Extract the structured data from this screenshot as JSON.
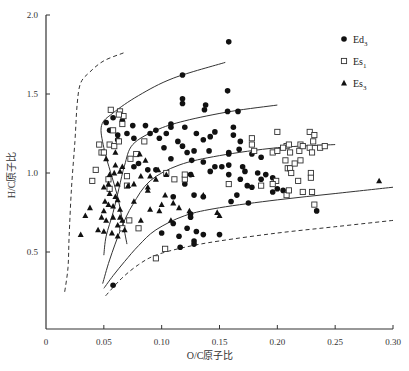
{
  "chart_data": {
    "type": "scatter",
    "title": "",
    "xlabel": "O/C原子比",
    "ylabel": "H/C原子比",
    "xlim": [
      0,
      0.3
    ],
    "ylim": [
      0,
      2.0
    ],
    "xticks": [
      0,
      0.05,
      0.1,
      0.15,
      0.2,
      0.25,
      0.3
    ],
    "xtick_labels": [
      "0",
      "0.05",
      "0.10",
      "0.15",
      "0.20",
      "0.25",
      "0.30"
    ],
    "yticks": [
      0.5,
      1.0,
      1.5,
      2.0
    ],
    "ytick_labels": [
      "0.5",
      "1.0",
      "1.5",
      "2.0"
    ],
    "grid": false,
    "legend_position": "upper right",
    "legend": [
      {
        "label": "Ed",
        "subscript": "3",
        "marker": "filled-circle"
      },
      {
        "label": "Es",
        "subscript": "1",
        "marker": "open-square"
      },
      {
        "label": "Es",
        "subscript": "3",
        "marker": "filled-triangle"
      }
    ],
    "series": [
      {
        "name": "Ed3",
        "marker": "filled-circle",
        "points": [
          [
            0.158,
            1.83
          ],
          [
            0.118,
            1.62
          ],
          [
            0.118,
            1.47
          ],
          [
            0.118,
            1.44
          ],
          [
            0.157,
            1.52
          ],
          [
            0.138,
            1.43
          ],
          [
            0.137,
            1.4
          ],
          [
            0.157,
            1.39
          ],
          [
            0.166,
            1.39
          ],
          [
            0.108,
            1.31
          ],
          [
            0.108,
            1.29
          ],
          [
            0.098,
            1.22
          ],
          [
            0.104,
            1.25
          ],
          [
            0.066,
            1.33
          ],
          [
            0.075,
            1.3
          ],
          [
            0.058,
            1.35
          ],
          [
            0.052,
            1.32
          ],
          [
            0.055,
            1.27
          ],
          [
            0.062,
            1.24
          ],
          [
            0.07,
            1.25
          ],
          [
            0.076,
            1.22
          ],
          [
            0.062,
            1.21
          ],
          [
            0.086,
            1.3
          ],
          [
            0.09,
            1.25
          ],
          [
            0.095,
            1.27
          ],
          [
            0.142,
            1.23
          ],
          [
            0.146,
            1.26
          ],
          [
            0.136,
            1.21
          ],
          [
            0.13,
            1.25
          ],
          [
            0.12,
            1.29
          ],
          [
            0.128,
            1.14
          ],
          [
            0.141,
            1.14
          ],
          [
            0.162,
            1.24
          ],
          [
            0.168,
            1.2
          ],
          [
            0.162,
            1.29
          ],
          [
            0.102,
            1.16
          ],
          [
            0.108,
            1.09
          ],
          [
            0.114,
            1.2
          ],
          [
            0.118,
            1.17
          ],
          [
            0.122,
            1.13
          ],
          [
            0.126,
            1.08
          ],
          [
            0.136,
            1.07
          ],
          [
            0.142,
            1.01
          ],
          [
            0.146,
            1.04
          ],
          [
            0.152,
            1.04
          ],
          [
            0.158,
            1.13
          ],
          [
            0.158,
            1.12
          ],
          [
            0.158,
            1.05
          ],
          [
            0.158,
            0.99
          ],
          [
            0.167,
            1.15
          ],
          [
            0.17,
            1.04
          ],
          [
            0.172,
            1.01
          ],
          [
            0.168,
            0.96
          ],
          [
            0.178,
            0.91
          ],
          [
            0.165,
            0.86
          ],
          [
            0.174,
            0.92
          ],
          [
            0.186,
            1.1
          ],
          [
            0.19,
            0.99
          ],
          [
            0.196,
            0.97
          ],
          [
            0.178,
            1.12
          ],
          [
            0.183,
            1.0
          ],
          [
            0.186,
            0.96
          ],
          [
            0.2,
            0.9
          ],
          [
            0.205,
            0.89
          ],
          [
            0.196,
            0.88
          ],
          [
            0.125,
            0.99
          ],
          [
            0.12,
            0.93
          ],
          [
            0.128,
            0.86
          ],
          [
            0.136,
            0.85
          ],
          [
            0.11,
            0.85
          ],
          [
            0.125,
            0.74
          ],
          [
            0.125,
            0.72
          ],
          [
            0.11,
            0.68
          ],
          [
            0.122,
            0.65
          ],
          [
            0.115,
            0.6
          ],
          [
            0.128,
            0.57
          ],
          [
            0.128,
            0.55
          ],
          [
            0.1,
            0.62
          ],
          [
            0.08,
            1.06
          ],
          [
            0.076,
            1.04
          ],
          [
            0.088,
            1.02
          ],
          [
            0.095,
            1.02
          ],
          [
            0.175,
            0.81
          ],
          [
            0.16,
            0.82
          ],
          [
            0.15,
            0.61
          ],
          [
            0.234,
            0.76
          ],
          [
            0.058,
            0.29
          ],
          [
            0.13,
            0.63
          ],
          [
            0.136,
            0.61
          ],
          [
            0.116,
            0.53
          ]
        ]
      },
      {
        "name": "Es1",
        "marker": "open-square",
        "points": [
          [
            0.056,
            1.4
          ],
          [
            0.064,
            1.39
          ],
          [
            0.067,
            1.36
          ],
          [
            0.063,
            1.37
          ],
          [
            0.066,
            1.31
          ],
          [
            0.058,
            1.27
          ],
          [
            0.046,
            1.18
          ],
          [
            0.048,
            1.13
          ],
          [
            0.055,
            1.18
          ],
          [
            0.059,
            1.17
          ],
          [
            0.063,
            1.2
          ],
          [
            0.073,
            1.09
          ],
          [
            0.078,
            1.12
          ],
          [
            0.085,
            1.2
          ],
          [
            0.05,
            1.13
          ],
          [
            0.043,
            1.02
          ],
          [
            0.04,
            0.95
          ],
          [
            0.07,
            0.98
          ],
          [
            0.054,
            0.96
          ],
          [
            0.055,
            0.9
          ],
          [
            0.07,
            0.92
          ],
          [
            0.104,
            1.0
          ],
          [
            0.111,
            0.96
          ],
          [
            0.12,
            0.96
          ],
          [
            0.12,
            0.99
          ],
          [
            0.072,
            0.7
          ],
          [
            0.066,
            0.65
          ],
          [
            0.08,
            0.65
          ],
          [
            0.095,
            0.46
          ],
          [
            0.103,
            0.52
          ],
          [
            0.158,
            0.93
          ],
          [
            0.196,
            1.13
          ],
          [
            0.207,
            1.08
          ],
          [
            0.209,
            1.03
          ],
          [
            0.211,
            1.03
          ],
          [
            0.22,
            1.18
          ],
          [
            0.228,
            1.16
          ],
          [
            0.231,
            1.2
          ],
          [
            0.237,
            1.16
          ],
          [
            0.229,
            1.0
          ],
          [
            0.229,
            0.97
          ],
          [
            0.211,
            1.13
          ],
          [
            0.219,
            1.14
          ],
          [
            0.212,
            1.0
          ],
          [
            0.215,
            1.06
          ],
          [
            0.178,
            1.18
          ],
          [
            0.18,
            1.14
          ],
          [
            0.2,
            1.14
          ],
          [
            0.208,
            1.17
          ],
          [
            0.205,
            1.16
          ],
          [
            0.222,
            1.17
          ],
          [
            0.23,
            1.13
          ],
          [
            0.241,
            1.17
          ],
          [
            0.186,
            0.92
          ],
          [
            0.199,
            0.95
          ],
          [
            0.218,
            0.95
          ],
          [
            0.196,
            0.93
          ],
          [
            0.22,
            1.08
          ],
          [
            0.23,
            0.88
          ],
          [
            0.232,
            0.8
          ],
          [
            0.208,
            0.86
          ],
          [
            0.21,
            0.89
          ],
          [
            0.222,
            0.88
          ],
          [
            0.228,
            1.26
          ],
          [
            0.21,
            1.18
          ],
          [
            0.178,
            1.22
          ],
          [
            0.2,
            1.26
          ],
          [
            0.232,
            1.24
          ]
        ]
      },
      {
        "name": "Es3",
        "marker": "filled-triangle",
        "points": [
          [
            0.06,
            1.13
          ],
          [
            0.081,
            1.12
          ],
          [
            0.086,
            1.08
          ],
          [
            0.097,
            1.02
          ],
          [
            0.104,
            0.99
          ],
          [
            0.052,
            1.09
          ],
          [
            0.06,
            1.05
          ],
          [
            0.066,
            1.04
          ],
          [
            0.064,
            1.01
          ],
          [
            0.059,
            1.0
          ],
          [
            0.082,
            0.98
          ],
          [
            0.09,
            0.98
          ],
          [
            0.076,
            0.93
          ],
          [
            0.088,
            0.91
          ],
          [
            0.055,
            0.99
          ],
          [
            0.054,
            0.93
          ],
          [
            0.062,
            0.93
          ],
          [
            0.071,
            0.92
          ],
          [
            0.076,
            0.82
          ],
          [
            0.05,
            0.91
          ],
          [
            0.055,
            0.87
          ],
          [
            0.06,
            0.85
          ],
          [
            0.051,
            0.82
          ],
          [
            0.058,
            0.79
          ],
          [
            0.064,
            0.77
          ],
          [
            0.062,
            0.83
          ],
          [
            0.058,
            0.72
          ],
          [
            0.066,
            0.7
          ],
          [
            0.05,
            0.76
          ],
          [
            0.054,
            0.8
          ],
          [
            0.048,
            0.72
          ],
          [
            0.052,
            0.7
          ],
          [
            0.045,
            0.64
          ],
          [
            0.05,
            0.63
          ],
          [
            0.057,
            0.62
          ],
          [
            0.062,
            0.67
          ],
          [
            0.068,
            0.64
          ],
          [
            0.064,
            0.72
          ],
          [
            0.062,
            0.6
          ],
          [
            0.034,
            0.73
          ],
          [
            0.038,
            0.78
          ],
          [
            0.03,
            0.61
          ],
          [
            0.095,
            0.96
          ],
          [
            0.088,
            0.89
          ],
          [
            0.1,
            0.8
          ],
          [
            0.09,
            0.77
          ],
          [
            0.098,
            0.76
          ],
          [
            0.108,
            0.7
          ],
          [
            0.115,
            0.78
          ],
          [
            0.082,
            0.7
          ],
          [
            0.103,
            0.86
          ],
          [
            0.11,
            0.81
          ],
          [
            0.136,
            0.86
          ],
          [
            0.126,
            0.99
          ],
          [
            0.148,
            0.75
          ],
          [
            0.15,
            0.73
          ],
          [
            0.124,
            0.76
          ],
          [
            0.288,
            0.95
          ]
        ]
      }
    ],
    "curves": [
      {
        "name": "boundary-left-dashed",
        "style": "dashed",
        "points": [
          [
            0.067,
            1.76
          ],
          [
            0.05,
            1.71
          ],
          [
            0.038,
            1.64
          ],
          [
            0.03,
            1.57
          ],
          [
            0.027,
            1.44
          ],
          [
            0.025,
            1.2
          ],
          [
            0.022,
            0.9
          ],
          [
            0.02,
            0.6
          ],
          [
            0.019,
            0.4
          ],
          [
            0.016,
            0.24
          ]
        ]
      },
      {
        "name": "type-I-upper",
        "style": "solid",
        "points": [
          [
            0.155,
            1.7
          ],
          [
            0.11,
            1.6
          ],
          [
            0.08,
            1.49
          ],
          [
            0.058,
            1.38
          ],
          [
            0.048,
            1.3
          ],
          [
            0.05,
            1.16
          ],
          [
            0.056,
            1.0
          ],
          [
            0.062,
            0.85
          ],
          [
            0.066,
            0.7
          ],
          [
            0.07,
            0.55
          ]
        ]
      },
      {
        "name": "type-I-II",
        "style": "solid",
        "points": [
          [
            0.2,
            1.43
          ],
          [
            0.16,
            1.39
          ],
          [
            0.12,
            1.33
          ],
          [
            0.095,
            1.27
          ],
          [
            0.075,
            1.18
          ],
          [
            0.068,
            1.05
          ],
          [
            0.063,
            0.9
          ],
          [
            0.058,
            0.75
          ],
          [
            0.052,
            0.6
          ],
          [
            0.05,
            0.48
          ]
        ]
      },
      {
        "name": "type-II",
        "style": "solid",
        "points": [
          [
            0.25,
            1.18
          ],
          [
            0.2,
            1.16
          ],
          [
            0.15,
            1.11
          ],
          [
            0.115,
            1.05
          ],
          [
            0.09,
            0.95
          ],
          [
            0.075,
            0.8
          ],
          [
            0.065,
            0.65
          ],
          [
            0.055,
            0.45
          ],
          [
            0.049,
            0.3
          ]
        ]
      },
      {
        "name": "type-III",
        "style": "solid",
        "points": [
          [
            0.3,
            0.91
          ],
          [
            0.25,
            0.87
          ],
          [
            0.2,
            0.83
          ],
          [
            0.15,
            0.78
          ],
          [
            0.12,
            0.73
          ],
          [
            0.095,
            0.64
          ],
          [
            0.08,
            0.54
          ],
          [
            0.068,
            0.44
          ],
          [
            0.058,
            0.35
          ],
          [
            0.05,
            0.27
          ]
        ]
      },
      {
        "name": "lower-bound-dashed",
        "style": "dashed",
        "points": [
          [
            0.3,
            0.7
          ],
          [
            0.25,
            0.66
          ],
          [
            0.2,
            0.62
          ],
          [
            0.15,
            0.57
          ],
          [
            0.12,
            0.53
          ],
          [
            0.095,
            0.48
          ],
          [
            0.08,
            0.42
          ],
          [
            0.065,
            0.33
          ],
          [
            0.05,
            0.21
          ]
        ]
      }
    ]
  }
}
